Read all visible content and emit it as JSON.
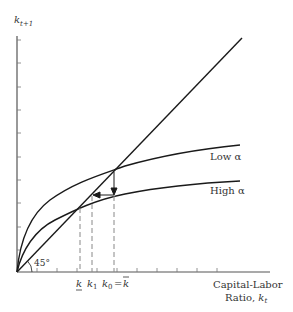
{
  "diagram": {
    "type": "phase-diagram",
    "y_axis": {
      "label_main": "k",
      "label_sub": "t+1"
    },
    "x_axis": {
      "label_line1": "Capital-Labor",
      "label_line2_prefix": "Ratio, ",
      "label_line2_var": "k",
      "label_line2_sub": "t"
    },
    "angle_label": "45°",
    "curves": [
      {
        "name": "Low α",
        "label": "Low α"
      },
      {
        "name": "High α",
        "label": "High α"
      },
      {
        "name": "45-degree line",
        "label": ""
      }
    ],
    "x_markers": {
      "k_low": "k",
      "k1_main": "k",
      "k1_sub": "1",
      "k0_main": "k",
      "k0_sub": "0",
      "k0_eq": "=",
      "k_bar": "k"
    },
    "colors": {
      "line": "#1a1a1a",
      "dashed": "#888888",
      "axis": "#555555",
      "text": "#333333"
    }
  }
}
